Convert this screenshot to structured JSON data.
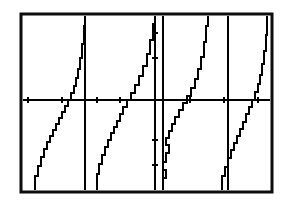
{
  "figure": {
    "kind": "graphing-calculator-screen",
    "background_color": "#ffffff",
    "ink_color": "#000000",
    "frame": {
      "name": "calculator-screen-border",
      "x": 21,
      "y": 14,
      "width": 251,
      "height": 178,
      "stroke_width": 3
    },
    "caption": ""
  },
  "chart_data": {
    "type": "line",
    "title": "",
    "subtitle": "",
    "xlabel": "",
    "ylabel": "",
    "function": "y = tan(x)",
    "grid": false,
    "legend": null,
    "legend_position": "none",
    "axis_style": "calculator-tickmarks",
    "xlim": [
      -7.85,
      7.85
    ],
    "ylim": [
      -4,
      4
    ],
    "x_axis": {
      "name": "x-axis",
      "pixel_y": 100,
      "pixel_x_start": 23,
      "pixel_x_end": 270,
      "tick_pixel_positions": [
        28,
        62,
        97,
        120,
        155,
        190,
        224,
        258
      ],
      "tick_length": 6,
      "tick_values": [
        -7.0,
        -5.5,
        -4.0,
        -3.0,
        0.0,
        1.5,
        3.0,
        4.5
      ]
    },
    "y_axis": {
      "name": "y-axis",
      "pixel_x": 155,
      "pixel_y_start": 16,
      "pixel_y_end": 190,
      "tick_pixel_positions": [
        33,
        58,
        140,
        165
      ],
      "tick_length": 6,
      "tick_values": [
        3.0,
        1.5,
        -1.5,
        -3.0
      ]
    },
    "asymptotes": {
      "name": "vertical-asymptotes",
      "pixel_x": [
        85,
        155,
        163,
        228
      ],
      "x_values": [
        -4.712,
        -1.571,
        -1.571,
        1.571
      ]
    },
    "series": [
      {
        "name": "tan-branch-1",
        "points_px": [
          [
            35,
            190
          ],
          [
            35,
            176
          ],
          [
            38,
            176
          ],
          [
            38,
            166
          ],
          [
            41,
            166
          ],
          [
            41,
            157
          ],
          [
            44,
            157
          ],
          [
            44,
            149
          ],
          [
            47,
            149
          ],
          [
            47,
            142
          ],
          [
            50,
            142
          ],
          [
            50,
            136
          ],
          [
            53,
            136
          ],
          [
            53,
            130
          ],
          [
            56,
            130
          ],
          [
            56,
            124
          ],
          [
            59,
            124
          ],
          [
            59,
            118
          ],
          [
            62,
            118
          ],
          [
            62,
            112
          ],
          [
            65,
            112
          ],
          [
            65,
            106
          ],
          [
            68,
            106
          ],
          [
            68,
            100
          ],
          [
            71,
            100
          ],
          [
            71,
            93
          ],
          [
            74,
            93
          ],
          [
            74,
            86
          ],
          [
            76,
            86
          ],
          [
            76,
            78
          ],
          [
            78,
            78
          ],
          [
            78,
            69
          ],
          [
            80,
            69
          ],
          [
            80,
            58
          ],
          [
            82,
            58
          ],
          [
            82,
            44
          ],
          [
            84,
            44
          ],
          [
            84,
            26
          ],
          [
            85,
            26
          ],
          [
            85,
            16
          ]
        ]
      },
      {
        "name": "tan-branch-2",
        "points_px": [
          [
            97,
            190
          ],
          [
            97,
            174
          ],
          [
            99,
            174
          ],
          [
            99,
            164
          ],
          [
            102,
            164
          ],
          [
            102,
            155
          ],
          [
            105,
            155
          ],
          [
            105,
            147
          ],
          [
            108,
            147
          ],
          [
            108,
            140
          ],
          [
            111,
            140
          ],
          [
            111,
            133
          ],
          [
            114,
            133
          ],
          [
            114,
            127
          ],
          [
            117,
            127
          ],
          [
            117,
            121
          ],
          [
            120,
            121
          ],
          [
            120,
            114
          ],
          [
            123,
            114
          ],
          [
            123,
            107
          ],
          [
            127,
            107
          ],
          [
            127,
            100
          ],
          [
            131,
            100
          ],
          [
            131,
            93
          ],
          [
            135,
            93
          ],
          [
            135,
            85
          ],
          [
            139,
            85
          ],
          [
            139,
            76
          ],
          [
            143,
            76
          ],
          [
            143,
            66
          ],
          [
            147,
            66
          ],
          [
            147,
            54
          ],
          [
            150,
            54
          ],
          [
            150,
            40
          ],
          [
            153,
            40
          ],
          [
            153,
            24
          ],
          [
            155,
            24
          ],
          [
            155,
            16
          ]
        ]
      },
      {
        "name": "tan-branch-3",
        "points_px": [
          [
            163,
            190
          ],
          [
            163,
            178
          ],
          [
            166,
            178
          ],
          [
            166,
            170
          ],
          [
            163,
            170
          ],
          [
            163,
            162
          ],
          [
            166,
            162
          ],
          [
            166,
            153
          ],
          [
            169,
            153
          ],
          [
            169,
            145
          ],
          [
            166,
            145
          ],
          [
            166,
            138
          ],
          [
            169,
            138
          ],
          [
            169,
            131
          ],
          [
            172,
            131
          ],
          [
            172,
            124
          ],
          [
            175,
            124
          ],
          [
            175,
            117
          ],
          [
            179,
            117
          ],
          [
            179,
            110
          ],
          [
            183,
            110
          ],
          [
            183,
            103
          ],
          [
            187,
            103
          ],
          [
            187,
            96
          ],
          [
            191,
            96
          ],
          [
            191,
            88
          ],
          [
            195,
            88
          ],
          [
            195,
            79
          ],
          [
            198,
            79
          ],
          [
            198,
            69
          ],
          [
            201,
            69
          ],
          [
            201,
            57
          ],
          [
            204,
            57
          ],
          [
            204,
            42
          ],
          [
            206,
            42
          ],
          [
            206,
            26
          ],
          [
            208,
            26
          ],
          [
            208,
            16
          ]
        ]
      },
      {
        "name": "tan-branch-4",
        "points_px": [
          [
            222,
            190
          ],
          [
            222,
            176
          ],
          [
            225,
            176
          ],
          [
            225,
            167
          ],
          [
            228,
            167
          ],
          [
            228,
            158
          ],
          [
            231,
            158
          ],
          [
            231,
            150
          ],
          [
            234,
            150
          ],
          [
            234,
            143
          ],
          [
            237,
            143
          ],
          [
            237,
            136
          ],
          [
            240,
            136
          ],
          [
            240,
            129
          ],
          [
            243,
            129
          ],
          [
            243,
            122
          ],
          [
            246,
            122
          ],
          [
            246,
            114
          ],
          [
            249,
            114
          ],
          [
            249,
            107
          ],
          [
            252,
            107
          ],
          [
            252,
            100
          ],
          [
            255,
            100
          ],
          [
            255,
            92
          ],
          [
            258,
            92
          ],
          [
            258,
            84
          ],
          [
            260,
            84
          ],
          [
            260,
            75
          ],
          [
            262,
            75
          ],
          [
            262,
            64
          ],
          [
            264,
            64
          ],
          [
            264,
            51
          ],
          [
            266,
            51
          ],
          [
            266,
            35
          ],
          [
            267,
            35
          ],
          [
            267,
            16
          ]
        ]
      }
    ]
  }
}
